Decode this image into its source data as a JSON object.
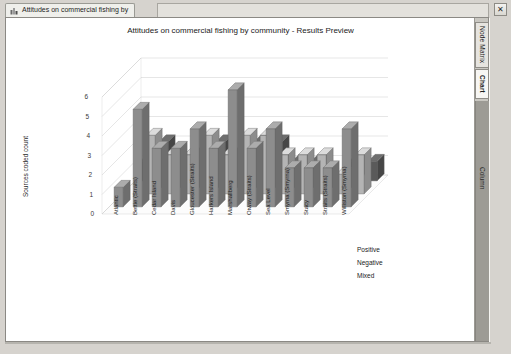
{
  "window": {
    "tab_label": "Attitudes on commercial fishing by",
    "tab_icon": "chart-icon",
    "close_label": "✕"
  },
  "rail": {
    "tabs": [
      {
        "label": "Node Matrix",
        "name": "node-matrix"
      },
      {
        "label": "Chart",
        "name": "chart"
      }
    ],
    "column_label": "Column"
  },
  "chart_data": {
    "type": "bar",
    "title": "Attitudes on commercial fishing by community - Results Preview",
    "xlabel": "Row",
    "ylabel": "Sources coded count",
    "ylim": [
      0,
      6
    ],
    "yticks": [
      0,
      1,
      2,
      3,
      4,
      5,
      6
    ],
    "grid": true,
    "legend_position": "right",
    "projection": "3d",
    "categories": [
      "Atlantic",
      "Bettie (Straits)",
      "Cedar Island",
      "Davis",
      "Gloucester (Straits)",
      "Harkers Island",
      "Marshallberg",
      "Otway (Straits)",
      "Sea Level",
      "Smyrna (Smyrna)",
      "Stacy",
      "Straits (Straits)",
      "Williston (Smyrna)"
    ],
    "series": [
      {
        "name": "Positive",
        "color": "#8d8d8d",
        "values": [
          1,
          5,
          3,
          3,
          4,
          3,
          6,
          3,
          4,
          2,
          2,
          2,
          4
        ]
      },
      {
        "name": "Negative",
        "color": "#b4b4b4",
        "values": [
          0,
          3,
          2,
          2,
          3,
          2,
          3,
          3,
          2,
          2,
          2,
          1,
          2
        ]
      },
      {
        "name": "Mixed",
        "color": "#5a5a5a",
        "values": [
          1,
          2,
          1,
          1,
          2,
          1,
          2,
          2,
          1,
          1,
          0,
          1,
          1
        ]
      }
    ]
  }
}
